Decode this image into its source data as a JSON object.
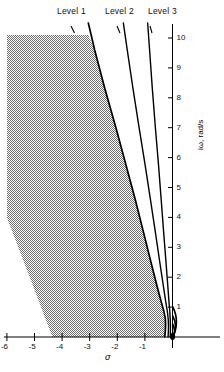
{
  "chart_data": {
    "type": "line",
    "title": "",
    "xlabel": "σ",
    "ylabel": "iω, rad/s",
    "xlim": [
      -6.6,
      0.35
    ],
    "ylim": [
      -0.45,
      10.8
    ],
    "grid": false,
    "legend_position": "top",
    "x_ticks": [
      -6,
      -5,
      -4,
      -3,
      -2,
      -1
    ],
    "x_tick_labels": [
      "-6",
      "-5",
      "-4",
      "-3",
      "-2",
      "-1"
    ],
    "y_ticks": [
      1,
      2,
      3,
      4,
      5,
      6,
      7,
      8,
      9,
      10
    ],
    "y_tick_labels": [
      "1",
      "2",
      "3",
      "4",
      "5",
      "6",
      "7",
      "8",
      "9",
      "10"
    ],
    "series": [
      {
        "name": "Level 1",
        "label_text": "Level 1",
        "points": [
          [
            -3.05,
            10.5
          ],
          [
            -2.82,
            9.6
          ],
          [
            -2.45,
            8.3
          ],
          [
            -2.05,
            7.0
          ],
          [
            -1.7,
            5.8
          ],
          [
            -1.35,
            4.6
          ],
          [
            -1.05,
            3.5
          ],
          [
            -0.78,
            2.5
          ],
          [
            -0.56,
            1.7
          ],
          [
            -0.4,
            1.15
          ],
          [
            -0.31,
            0.85
          ],
          [
            -0.26,
            0.62
          ],
          [
            -0.25,
            0.4
          ],
          [
            -0.26,
            0.2
          ],
          [
            -0.28,
            0.0
          ]
        ]
      },
      {
        "name": "Level 2",
        "label_text": "Level 2",
        "points": [
          [
            -1.78,
            10.5
          ],
          [
            -1.64,
            9.6
          ],
          [
            -1.43,
            8.3
          ],
          [
            -1.21,
            7.0
          ],
          [
            -1.0,
            5.8
          ],
          [
            -0.8,
            4.6
          ],
          [
            -0.62,
            3.5
          ],
          [
            -0.46,
            2.5
          ],
          [
            -0.33,
            1.7
          ],
          [
            -0.24,
            1.15
          ],
          [
            -0.185,
            0.85
          ],
          [
            -0.155,
            0.6
          ],
          [
            -0.145,
            0.38
          ],
          [
            -0.15,
            0.18
          ],
          [
            -0.16,
            0.0
          ]
        ]
      },
      {
        "name": "Level 3",
        "label_text": "Level 3",
        "points": [
          [
            -0.9,
            10.5
          ],
          [
            -0.83,
            9.6
          ],
          [
            -0.73,
            8.3
          ],
          [
            -0.62,
            7.0
          ],
          [
            -0.51,
            5.8
          ],
          [
            -0.41,
            4.6
          ],
          [
            -0.32,
            3.5
          ],
          [
            -0.235,
            2.5
          ],
          [
            -0.17,
            1.7
          ],
          [
            -0.125,
            1.15
          ],
          [
            -0.095,
            0.82
          ],
          [
            -0.08,
            0.55
          ],
          [
            -0.075,
            0.33
          ],
          [
            -0.078,
            0.15
          ],
          [
            -0.08,
            0.0
          ]
        ]
      }
    ],
    "arcs": [
      {
        "name": "arc-outer",
        "radius": 1.02
      },
      {
        "name": "arc-middle",
        "radius": 0.72
      },
      {
        "name": "arc-inner",
        "radius": 0.45
      }
    ],
    "shaded_region": {
      "name": "unacceptable-region",
      "fill": "#9a9a9a",
      "vertices": [
        [
          -6.0,
          10.1
        ],
        [
          -3.05,
          10.1
        ],
        [
          -2.82,
          9.6
        ],
        [
          -2.45,
          8.3
        ],
        [
          -2.05,
          7.0
        ],
        [
          -1.7,
          5.8
        ],
        [
          -1.35,
          4.6
        ],
        [
          -1.05,
          3.5
        ],
        [
          -0.78,
          2.5
        ],
        [
          -0.56,
          1.7
        ],
        [
          -0.4,
          1.15
        ],
        [
          -0.31,
          0.85
        ],
        [
          -0.26,
          0.62
        ],
        [
          -0.25,
          0.4
        ],
        [
          -0.26,
          0.2
        ],
        [
          -0.28,
          0.0
        ],
        [
          -4.35,
          0.0
        ],
        [
          -6.0,
          4.0
        ]
      ]
    },
    "origin_marker": {
      "name": "pole-marker",
      "x": 0,
      "y": 0
    },
    "colors": {
      "line": "#000000",
      "shade": "#9a9a9a",
      "axis": "#000000"
    }
  },
  "labels": {
    "level1": "Level 1",
    "level2": "Level 2",
    "level3": "Level 3",
    "x_axis": "σ",
    "y_axis": "iω,  rad/s"
  }
}
